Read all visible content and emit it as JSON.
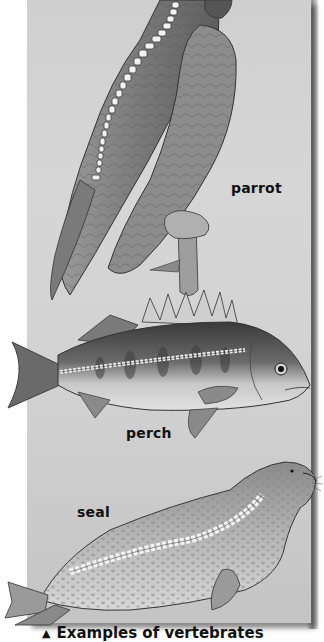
{
  "figure": {
    "background_color": "#d2d2d2",
    "animals": [
      {
        "name": "parrot",
        "label": "parrot"
      },
      {
        "name": "perch",
        "label": "perch"
      },
      {
        "name": "seal",
        "label": "seal"
      }
    ],
    "caption": {
      "marker": "▲",
      "text": "Examples of vertebrates"
    }
  }
}
